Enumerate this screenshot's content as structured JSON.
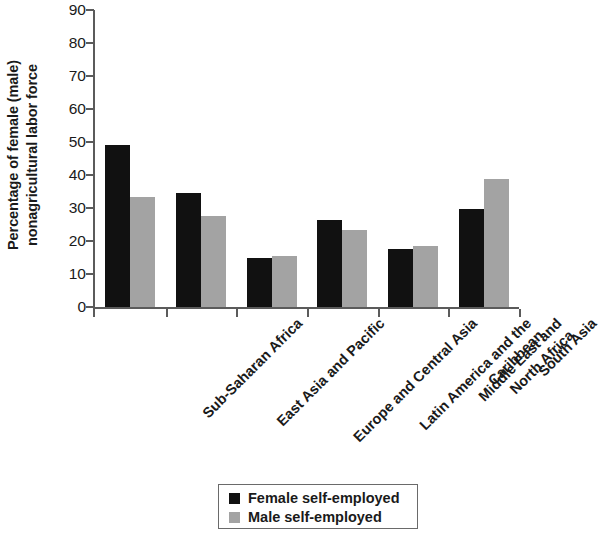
{
  "chart_data": {
    "type": "bar",
    "title": "",
    "xlabel": "",
    "ylabel_lines": [
      "Percentage of female (male)",
      "nonagricultural labor force"
    ],
    "ylabel": "Percentage of female (male) nonagricultural labor force",
    "categories": [
      "Sub-Saharan Africa",
      "East Asia and Pacific",
      "Europe and Central Asia",
      "Latin America and the Caribbean",
      "Middle East and North Africa",
      "South Asia"
    ],
    "category_lines": [
      [
        "Sub-Saharan Africa"
      ],
      [
        "East Asia and Pacific"
      ],
      [
        "Europe and Central Asia"
      ],
      [
        "Latin America and the",
        "Caribbean"
      ],
      [
        "Middle East and",
        "North Africa"
      ],
      [
        "South Asia"
      ]
    ],
    "series": [
      {
        "name": "Female self-employed",
        "color": "#111111",
        "values": [
          49.0,
          34.7,
          15.0,
          26.3,
          17.5,
          29.8
        ]
      },
      {
        "name": "Male self-employed",
        "color": "#a3a3a3",
        "values": [
          33.4,
          27.7,
          15.5,
          23.4,
          18.6,
          38.7
        ]
      }
    ],
    "ylim": [
      0,
      90
    ],
    "yticks": [
      0,
      10,
      20,
      30,
      40,
      50,
      60,
      70,
      80,
      90
    ],
    "ytick_labels": [
      "0",
      "10",
      "20",
      "30",
      "40",
      "50",
      "60",
      "70",
      "80",
      "90"
    ],
    "grid": false,
    "legend_position": "bottom-center"
  },
  "legend": {
    "entries": [
      {
        "label": "Female self-employed",
        "color": "#111111"
      },
      {
        "label": "Male self-employed",
        "color": "#a3a3a3"
      }
    ]
  },
  "colors": {
    "female_bar": "#111111",
    "male_bar": "#a3a3a3",
    "axis": "#5b5b5b",
    "text": "#1a1a1a",
    "background": "#ffffff"
  }
}
